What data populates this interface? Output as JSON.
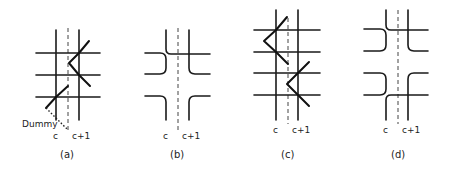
{
  "figure": {
    "panels": [
      {
        "caption": "(a)",
        "col_left": "c",
        "col_right": "c+1",
        "annotation": "Dummy"
      },
      {
        "caption": "(b)",
        "col_left": "c",
        "col_right": "c+1"
      },
      {
        "caption": "(c)",
        "col_left": "c",
        "col_right": "c+1"
      },
      {
        "caption": "(d)",
        "col_left": "c",
        "col_right": "c+1"
      }
    ]
  }
}
